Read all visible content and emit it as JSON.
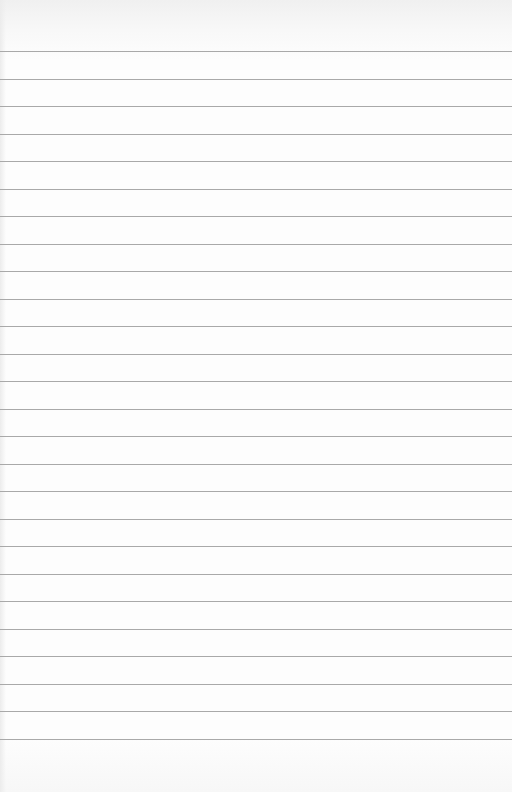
{
  "page": {
    "type": "ruled-paper",
    "background_color": "#fdfdfd",
    "rule_color": "#a9a9a9",
    "first_rule_y": 51,
    "rule_spacing": 27.5,
    "rule_count": 26
  }
}
